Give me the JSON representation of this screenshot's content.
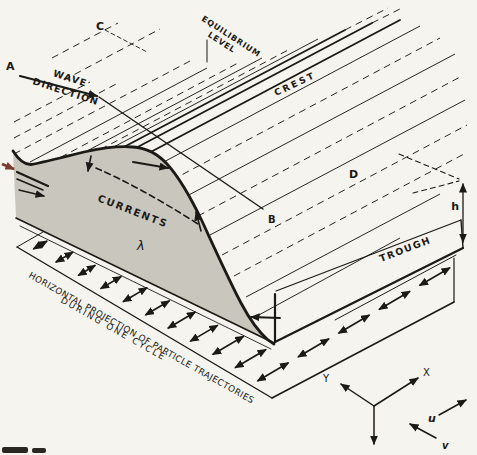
{
  "figure": {
    "labels": {
      "point_a": "A",
      "point_b": "B",
      "point_c": "C",
      "point_d": "D",
      "wave_line1": "WAVE",
      "wave_line2": "DIRECTION",
      "equilibrium_line1": "EQUILIBRIUM",
      "equilibrium_line2": "LEVEL",
      "crest": "CREST",
      "trough": "TROUGH",
      "currents": "CURRENTS",
      "lambda": "λ",
      "depth_h": "h",
      "caption_line1": "HORIZONTAL PROJECTION OF PARTICLE TRAJECTORIES",
      "caption_line2": "DURING ONE CYCLE",
      "axis_x": "X",
      "axis_y": "Y",
      "vel_u": "u",
      "vel_v": "v"
    },
    "colors": {
      "ink": "#1c1a17",
      "paper": "#f6f4ee",
      "face_shade": "#c9c6bd",
      "accent_red": "#7a3d30"
    }
  }
}
